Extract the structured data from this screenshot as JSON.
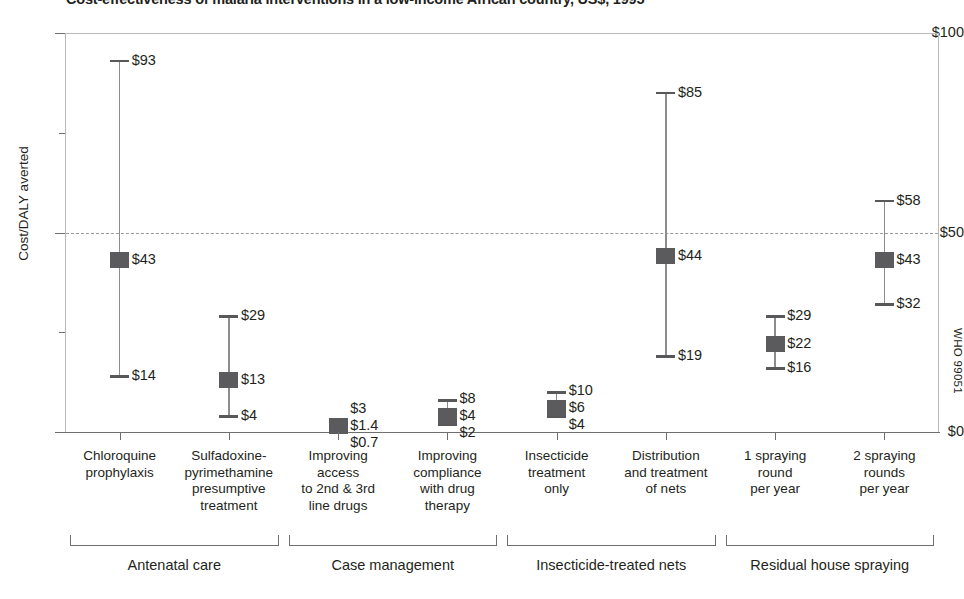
{
  "chart_data": {
    "type": "bar",
    "title": "Cost-effectiveness of malaria interventions in a low-income African country, US$, 1995",
    "xlabel": "",
    "ylabel": "Cost/DALY averted",
    "ylim": [
      0,
      100
    ],
    "ytick_labels": [
      "$0",
      "$50",
      "$100"
    ],
    "ytick_values": [
      0,
      50,
      100
    ],
    "minor_tick_values": [
      25,
      75
    ],
    "grid": "dashed horizontal line at $50 only",
    "legend": "none",
    "value_prefix": "$",
    "categories": [
      "Chloroquine prophylaxis",
      "Sulfadoxine-pyrimethamine presumptive treatment",
      "Improving access to 2nd & 3rd line drugs",
      "Improving compliance with drug therapy",
      "Insecticide treatment only",
      "Distribution and treatment of nets",
      "1 spraying round per year",
      "2 spraying rounds per year"
    ],
    "category_lines": [
      [
        "Chloroquine",
        "prophylaxis"
      ],
      [
        "Sulfadoxine-",
        "pyrimethamine",
        "presumptive",
        "treatment"
      ],
      [
        "Improving",
        "access",
        "to 2nd & 3rd",
        "line drugs"
      ],
      [
        "Improving",
        "compliance",
        "with drug",
        "therapy"
      ],
      [
        "Insecticide",
        "treatment",
        "only"
      ],
      [
        "Distribution",
        "and  treatment",
        "of nets"
      ],
      [
        "1 spraying",
        "round",
        "per year"
      ],
      [
        "2 spraying",
        "rounds",
        "per year"
      ]
    ],
    "series": [
      {
        "name": "high",
        "values": [
          93,
          29,
          3,
          8,
          10,
          85,
          29,
          58
        ]
      },
      {
        "name": "central",
        "values": [
          43,
          13,
          1.4,
          4,
          6,
          44,
          22,
          43
        ]
      },
      {
        "name": "low",
        "values": [
          14,
          4,
          0.7,
          2,
          4,
          19,
          16,
          32
        ]
      }
    ],
    "points": [
      {
        "category": "Chloroquine prophylaxis",
        "high": 93,
        "central": 43,
        "low": 14,
        "high_label": "$93",
        "central_label": "$43",
        "low_label": "$14"
      },
      {
        "category": "Sulfadoxine-pyrimethamine presumptive treatment",
        "high": 29,
        "central": 13,
        "low": 4,
        "high_label": "$29",
        "central_label": "$13",
        "low_label": "$4"
      },
      {
        "category": "Improving access to 2nd & 3rd line drugs",
        "high": 3,
        "central": 1.4,
        "low": 0.7,
        "high_label": "$3",
        "central_label": "$1.4",
        "low_label": "$0.7"
      },
      {
        "category": "Improving compliance with drug therapy",
        "high": 8,
        "central": 4,
        "low": 2,
        "high_label": "$8",
        "central_label": "$4",
        "low_label": "$2"
      },
      {
        "category": "Insecticide treatment only",
        "high": 10,
        "central": 6,
        "low": 4,
        "high_label": "$10",
        "central_label": "$6",
        "low_label": "$4"
      },
      {
        "category": "Distribution and treatment of nets",
        "high": 85,
        "central": 44,
        "low": 19,
        "high_label": "$85",
        "central_label": "$44",
        "low_label": "$19"
      },
      {
        "category": "1 spraying round per year",
        "high": 29,
        "central": 22,
        "low": 16,
        "high_label": "$29",
        "central_label": "$22",
        "low_label": "$16"
      },
      {
        "category": "2 spraying rounds per year",
        "high": 58,
        "central": 43,
        "low": 32,
        "high_label": "$58",
        "central_label": "$43",
        "low_label": "$32"
      }
    ],
    "groups": [
      {
        "label": "Antenatal care",
        "categories": [
          0,
          1
        ]
      },
      {
        "label": "Case management",
        "categories": [
          2,
          3
        ]
      },
      {
        "label": "Insecticide-treated nets",
        "categories": [
          4,
          5
        ]
      },
      {
        "label": "Residual house spraying",
        "categories": [
          6,
          7
        ]
      }
    ],
    "colors": {
      "marker": "#5b5b5d",
      "whisker": "#8c8c8c",
      "axis": "#6e6e6e",
      "gridline": "#9a9a9a",
      "text": "#231f20",
      "background": "#ffffff"
    }
  },
  "credit": {
    "text": "WHO 99051"
  },
  "y_labels": {
    "top": "$100",
    "mid": "$50",
    "bottom": "$0",
    "axis_title": "Cost/DALY averted"
  }
}
